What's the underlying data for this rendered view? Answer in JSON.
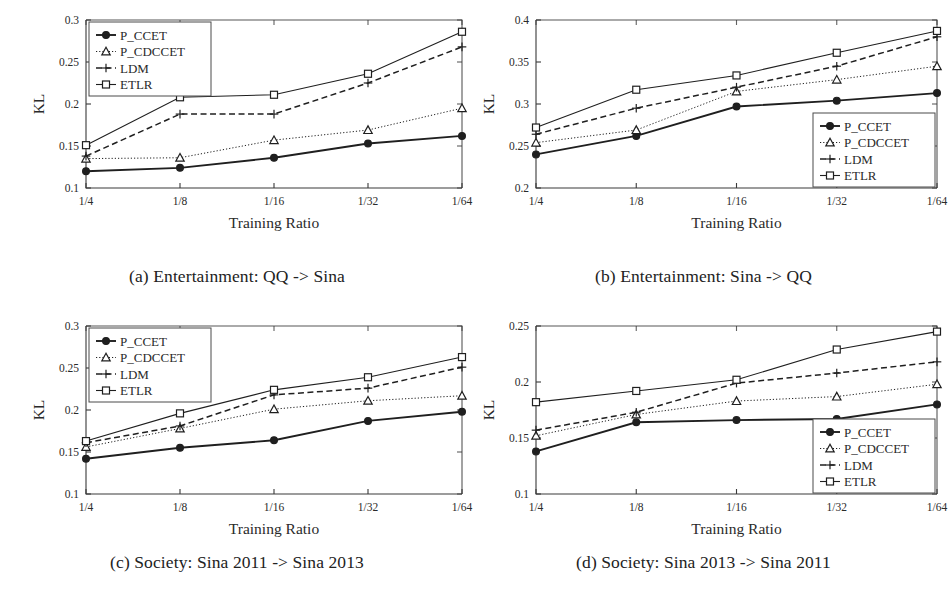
{
  "figure": {
    "series_names": [
      "P_CCET",
      "P_CDCCET",
      "LDM",
      "ETLR"
    ],
    "xlabel": "Training Ratio",
    "ylabel": "KL",
    "categories": [
      "1/4",
      "1/8",
      "1/16",
      "1/32",
      "1/64"
    ]
  },
  "panels": [
    {
      "id": "a",
      "caption": "(a) Entertainment: QQ -> Sina",
      "legend_position": "top-left",
      "chart_data": {
        "type": "line",
        "title": "(a) Entertainment: QQ -> Sina",
        "xlabel": "Training Ratio",
        "ylabel": "KL",
        "categories": [
          "1/4",
          "1/8",
          "1/16",
          "1/32",
          "1/64"
        ],
        "ylim": [
          0.1,
          0.3
        ],
        "yticks": [
          0.1,
          0.15,
          0.2,
          0.25,
          0.3
        ],
        "yticklabels": [
          "0.1",
          "0.15",
          "0.2",
          "0.25",
          "0.3"
        ],
        "grid": false,
        "legend": "upper left",
        "series": [
          {
            "name": "P_CCET",
            "values": [
              0.12,
              0.124,
              0.136,
              0.153,
              0.162
            ]
          },
          {
            "name": "P_CDCCET",
            "values": [
              0.135,
              0.136,
              0.157,
              0.169,
              0.195
            ]
          },
          {
            "name": "LDM",
            "values": [
              0.138,
              0.188,
              0.188,
              0.225,
              0.268
            ]
          },
          {
            "name": "ETLR",
            "values": [
              0.151,
              0.208,
              0.211,
              0.236,
              0.286
            ]
          }
        ]
      }
    },
    {
      "id": "b",
      "caption": "(b) Entertainment: Sina -> QQ",
      "legend_position": "bottom-right",
      "chart_data": {
        "type": "line",
        "title": "(b) Entertainment: Sina -> QQ",
        "xlabel": "Training Ratio",
        "ylabel": "KL",
        "categories": [
          "1/4",
          "1/8",
          "1/16",
          "1/32",
          "1/64"
        ],
        "ylim": [
          0.2,
          0.4
        ],
        "yticks": [
          0.2,
          0.25,
          0.3,
          0.35,
          0.4
        ],
        "yticklabels": [
          "0.2",
          "0.25",
          "0.3",
          "0.35",
          "0.4"
        ],
        "grid": false,
        "legend": "lower right",
        "series": [
          {
            "name": "P_CCET",
            "values": [
              0.24,
              0.262,
              0.297,
              0.304,
              0.313
            ]
          },
          {
            "name": "P_CDCCET",
            "values": [
              0.254,
              0.269,
              0.315,
              0.329,
              0.345
            ]
          },
          {
            "name": "LDM",
            "values": [
              0.264,
              0.295,
              0.32,
              0.345,
              0.38
            ]
          },
          {
            "name": "ETLR",
            "values": [
              0.272,
              0.317,
              0.334,
              0.361,
              0.387
            ]
          }
        ]
      }
    },
    {
      "id": "c",
      "caption": "(c) Society: Sina 2011 -> Sina 2013",
      "legend_position": "top-left",
      "chart_data": {
        "type": "line",
        "title": "(c) Society: Sina 2011 -> Sina 2013",
        "xlabel": "Training Ratio",
        "ylabel": "KL",
        "categories": [
          "1/4",
          "1/8",
          "1/16",
          "1/32",
          "1/64"
        ],
        "ylim": [
          0.1,
          0.3
        ],
        "yticks": [
          0.1,
          0.15,
          0.2,
          0.25,
          0.3
        ],
        "yticklabels": [
          "0.1",
          "0.15",
          "0.2",
          "0.25",
          "0.3"
        ],
        "grid": false,
        "legend": "upper left",
        "series": [
          {
            "name": "P_CCET",
            "values": [
              0.142,
              0.155,
              0.164,
              0.187,
              0.198
            ]
          },
          {
            "name": "P_CDCCET",
            "values": [
              0.156,
              0.178,
              0.201,
              0.211,
              0.217
            ]
          },
          {
            "name": "LDM",
            "values": [
              0.161,
              0.181,
              0.218,
              0.226,
              0.251
            ]
          },
          {
            "name": "ETLR",
            "values": [
              0.163,
              0.196,
              0.224,
              0.239,
              0.263
            ]
          }
        ]
      }
    },
    {
      "id": "d",
      "caption": "(d) Society: Sina 2013 -> Sina 2011",
      "legend_position": "bottom-right",
      "chart_data": {
        "type": "line",
        "title": "(d) Society: Sina 2013 -> Sina 2011",
        "xlabel": "Training Ratio",
        "ylabel": "KL",
        "categories": [
          "1/4",
          "1/8",
          "1/16",
          "1/32",
          "1/64"
        ],
        "ylim": [
          0.1,
          0.25
        ],
        "yticks": [
          0.1,
          0.15,
          0.2,
          0.25
        ],
        "yticklabels": [
          "0.1",
          "0.15",
          "0.2",
          "0.25"
        ],
        "grid": false,
        "legend": "lower right",
        "series": [
          {
            "name": "P_CCET",
            "values": [
              0.138,
              0.164,
              0.166,
              0.167,
              0.18
            ]
          },
          {
            "name": "P_CDCCET",
            "values": [
              0.152,
              0.171,
              0.183,
              0.187,
              0.198
            ]
          },
          {
            "name": "LDM",
            "values": [
              0.157,
              0.173,
              0.199,
              0.208,
              0.218
            ]
          },
          {
            "name": "ETLR",
            "values": [
              0.182,
              0.192,
              0.202,
              0.229,
              0.245
            ]
          }
        ]
      }
    }
  ]
}
